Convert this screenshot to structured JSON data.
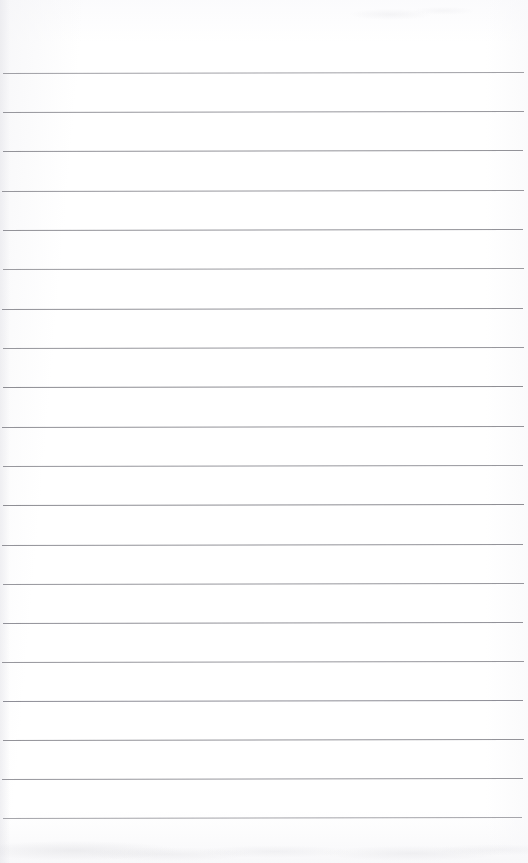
{
  "document": {
    "kind": "ruled-notepad-page",
    "title": "Blank ruled notepad page",
    "description": "Scanned blank lined writing paper with evenly spaced horizontal ruled lines and no written content.",
    "page_width": 528,
    "page_height": 863,
    "background_color": "#ffffff",
    "has_text_content": false,
    "has_margin_rule": false,
    "orientation": "portrait"
  },
  "ruling": {
    "line_color": "#8c8c92",
    "line_color_light": "#aeaeb4",
    "line_thickness_px": 1,
    "line_count": 20,
    "line_spacing_px": 39.2,
    "first_line_y": 73,
    "last_line_y": 818,
    "left_inset_px": 3,
    "right_inset_px": 5,
    "top_margin_px": 73,
    "bottom_margin_px": 45,
    "skew_degrees": -0.12,
    "lines": [
      {
        "index": 1,
        "y": 73,
        "x_start": 3,
        "x_end": 524,
        "color": "#909096",
        "opacity": 0.85
      },
      {
        "index": 2,
        "y": 112,
        "x_start": 3,
        "x_end": 524,
        "color": "#8c8c92",
        "opacity": 0.9
      },
      {
        "index": 3,
        "y": 151,
        "x_start": 3,
        "x_end": 523,
        "color": "#8a8a90",
        "opacity": 0.92
      },
      {
        "index": 4,
        "y": 191,
        "x_start": 2,
        "x_end": 524,
        "color": "#8c8c92",
        "opacity": 0.9
      },
      {
        "index": 5,
        "y": 230,
        "x_start": 3,
        "x_end": 523,
        "color": "#8a8a90",
        "opacity": 0.92
      },
      {
        "index": 6,
        "y": 269,
        "x_start": 3,
        "x_end": 524,
        "color": "#8e8e94",
        "opacity": 0.88
      },
      {
        "index": 7,
        "y": 309,
        "x_start": 2,
        "x_end": 523,
        "color": "#8a8a90",
        "opacity": 0.92
      },
      {
        "index": 8,
        "y": 348,
        "x_start": 3,
        "x_end": 524,
        "color": "#8c8c92",
        "opacity": 0.9
      },
      {
        "index": 9,
        "y": 387,
        "x_start": 3,
        "x_end": 523,
        "color": "#87878d",
        "opacity": 0.94
      },
      {
        "index": 10,
        "y": 427,
        "x_start": 2,
        "x_end": 524,
        "color": "#8a8a90",
        "opacity": 0.92
      },
      {
        "index": 11,
        "y": 466,
        "x_start": 3,
        "x_end": 523,
        "color": "#8c8c92",
        "opacity": 0.9
      },
      {
        "index": 12,
        "y": 505,
        "x_start": 3,
        "x_end": 524,
        "color": "#87878d",
        "opacity": 0.94
      },
      {
        "index": 13,
        "y": 545,
        "x_start": 2,
        "x_end": 523,
        "color": "#8a8a90",
        "opacity": 0.92
      },
      {
        "index": 14,
        "y": 584,
        "x_start": 3,
        "x_end": 524,
        "color": "#8c8c92",
        "opacity": 0.9
      },
      {
        "index": 15,
        "y": 623,
        "x_start": 3,
        "x_end": 523,
        "color": "#898990",
        "opacity": 0.92
      },
      {
        "index": 16,
        "y": 662,
        "x_start": 2,
        "x_end": 524,
        "color": "#8c8c92",
        "opacity": 0.9
      },
      {
        "index": 17,
        "y": 701,
        "x_start": 3,
        "x_end": 523,
        "color": "#878790",
        "opacity": 0.94
      },
      {
        "index": 18,
        "y": 740,
        "x_start": 3,
        "x_end": 524,
        "color": "#8a8a90",
        "opacity": 0.92
      },
      {
        "index": 19,
        "y": 779,
        "x_start": 2,
        "x_end": 523,
        "color": "#8c8c92",
        "opacity": 0.9
      },
      {
        "index": 20,
        "y": 818,
        "x_start": 3,
        "x_end": 522,
        "color": "#929298",
        "opacity": 0.82
      }
    ]
  },
  "writing_rows": [
    {
      "index": 1,
      "text": "",
      "top": 74,
      "height": 38
    },
    {
      "index": 2,
      "text": "",
      "top": 113,
      "height": 38
    },
    {
      "index": 3,
      "text": "",
      "top": 152,
      "height": 38
    },
    {
      "index": 4,
      "text": "",
      "top": 192,
      "height": 38
    },
    {
      "index": 5,
      "text": "",
      "top": 231,
      "height": 38
    },
    {
      "index": 6,
      "text": "",
      "top": 270,
      "height": 38
    },
    {
      "index": 7,
      "text": "",
      "top": 310,
      "height": 38
    },
    {
      "index": 8,
      "text": "",
      "top": 349,
      "height": 38
    },
    {
      "index": 9,
      "text": "",
      "top": 388,
      "height": 38
    },
    {
      "index": 10,
      "text": "",
      "top": 428,
      "height": 38
    },
    {
      "index": 11,
      "text": "",
      "top": 467,
      "height": 38
    },
    {
      "index": 12,
      "text": "",
      "top": 506,
      "height": 38
    },
    {
      "index": 13,
      "text": "",
      "top": 546,
      "height": 38
    },
    {
      "index": 14,
      "text": "",
      "top": 585,
      "height": 38
    },
    {
      "index": 15,
      "text": "",
      "top": 624,
      "height": 38
    },
    {
      "index": 16,
      "text": "",
      "top": 663,
      "height": 38
    },
    {
      "index": 17,
      "text": "",
      "top": 702,
      "height": 38
    },
    {
      "index": 18,
      "text": "",
      "top": 741,
      "height": 38
    },
    {
      "index": 19,
      "text": "",
      "top": 780,
      "height": 38
    },
    {
      "index": 20,
      "text": "",
      "top": 819,
      "height": 38
    }
  ]
}
